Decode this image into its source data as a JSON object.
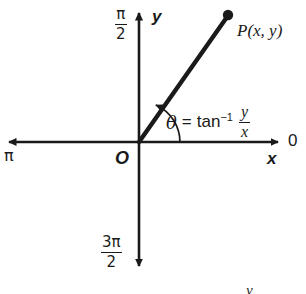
{
  "figure": {
    "type": "polar-angle-diagram",
    "background": "#ffffff",
    "stroke_color": "#1a1a1a",
    "text_color": "#1a1a1a"
  },
  "axes": {
    "y_axis_label": "y",
    "x_axis_label": "x",
    "origin_label": "O",
    "angle_right_label": "0",
    "angle_left_label": "π",
    "angle_up": {
      "numerator": "π",
      "denominator": "2"
    },
    "angle_down": {
      "numerator": "3π",
      "denominator": "2"
    }
  },
  "point": {
    "label": "P(x, y)"
  },
  "equation": {
    "theta": "θ",
    "equals": "=",
    "function": "tan",
    "exponent": "−1",
    "fraction_numerator": "y",
    "fraction_denominator": "x",
    "full_text": "θ = tan⁻¹ y/x"
  },
  "artifacts": {
    "bottom_edge_mark": "y"
  }
}
